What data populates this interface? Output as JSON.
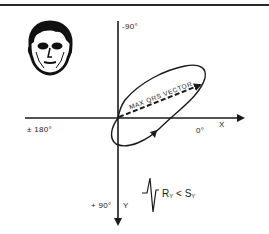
{
  "figure": {
    "type": "frontal-plane-axis-diagram",
    "axes": {
      "top_label": "-90°",
      "left_label": "± 180°",
      "right_label": "0°",
      "x_axis_label": "X",
      "bottom_label": "+ 90°",
      "y_axis_label": "Y"
    },
    "vector_label": "MAX QRS VECTOR",
    "equation": {
      "lhs": "R",
      "lhs_sub": "Y",
      "op": "<",
      "rhs": "S",
      "rhs_sub": "Y"
    },
    "icons": {
      "face": "human-face-icon",
      "ecg": "qrs-complex-waveform-icon"
    },
    "colors": {
      "ink": "#1a1a1a",
      "background": "#ffffff"
    }
  }
}
